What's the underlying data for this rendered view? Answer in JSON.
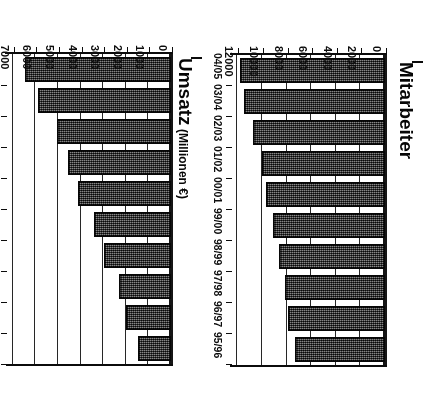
{
  "image": {
    "orientation": "rotated-180",
    "background": "#ffffff",
    "ink_color": "#111111",
    "bar_fill": "#4a4a4a",
    "bar_border": "#0d0d0d"
  },
  "chart_data": [
    {
      "id": "mitarbeiter",
      "type": "bar",
      "orientation": "horizontal",
      "title": "Mitarbeiter",
      "axis_title": "Mitarbeiter",
      "xlabel": "",
      "ylabel": "Mitarbeiter",
      "categories": [
        "95/96",
        "96/97",
        "97/98",
        "98/99",
        "99/00",
        "00/01",
        "01/02",
        "02/03",
        "03/04",
        "04/05"
      ],
      "values": [
        7300,
        7900,
        8100,
        8600,
        9100,
        9700,
        10000,
        10700,
        11500,
        11800
      ],
      "ticks": [
        0,
        2000,
        4000,
        6000,
        8000,
        10000,
        12000
      ],
      "tick_labels": [
        "0",
        "2000",
        "4000",
        "6000",
        "8000",
        "10000",
        "12000"
      ],
      "ylim": [
        0,
        12600
      ],
      "grid": true,
      "legend": false
    },
    {
      "id": "umsatz",
      "type": "bar",
      "orientation": "horizontal",
      "title": "Umsatz (Millionen €)",
      "axis_title_main": "Umsatz",
      "axis_title_unit": " (Millionen €)",
      "xlabel": "",
      "ylabel": "Umsatz (Millionen €)",
      "categories": [
        "95/96",
        "96/97",
        "97/98",
        "98/99",
        "99/00",
        "00/01",
        "01/02",
        "02/03",
        "03/04",
        "04/05"
      ],
      "values": [
        1450,
        2000,
        2300,
        2950,
        3400,
        4100,
        4550,
        5050,
        5900,
        6450
      ],
      "ticks": [
        0,
        1000,
        2000,
        3000,
        4000,
        5000,
        6000,
        7000
      ],
      "tick_labels": [
        "0",
        "1000",
        "2000",
        "3000",
        "4000",
        "5000",
        "6000",
        "7000"
      ],
      "ylim": [
        0,
        7350
      ],
      "grid": true,
      "legend": false
    }
  ]
}
